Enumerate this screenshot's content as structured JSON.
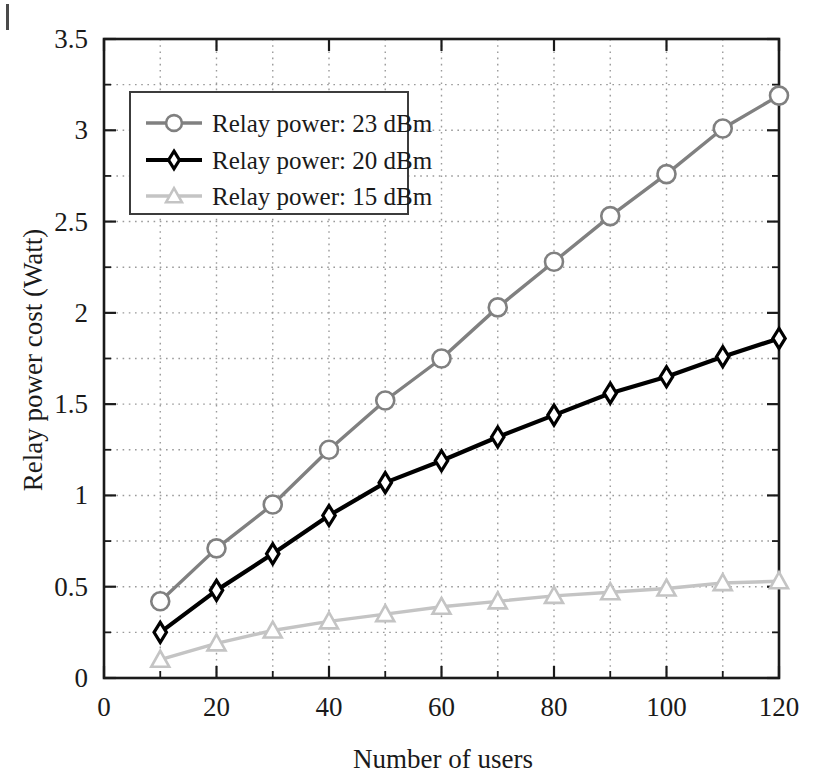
{
  "chart_data": {
    "type": "line",
    "title": "",
    "xlabel": "Number of users",
    "ylabel": "Relay power cost (Watt)",
    "xlim": [
      0,
      120
    ],
    "ylim": [
      0,
      3.5
    ],
    "xticks": [
      0,
      20,
      40,
      60,
      80,
      100,
      120
    ],
    "xticklabels": [
      "0",
      "20",
      "40",
      "60",
      "80",
      "100",
      "120"
    ],
    "yticks": [
      0,
      0.5,
      1,
      1.5,
      2,
      2.5,
      3,
      3.5
    ],
    "yticklabels": [
      "0",
      "0.5",
      "1",
      "1.5",
      "2",
      "2.5",
      "3",
      "3.5"
    ],
    "minor_tick_step_y": 0.25,
    "minor_tick_step_x": 10,
    "grid": true,
    "grid_style": "dotted",
    "legend_position": "upper left",
    "x": [
      10,
      20,
      30,
      40,
      50,
      60,
      70,
      80,
      90,
      100,
      110,
      120
    ],
    "series": [
      {
        "name": "Relay power: 23 dBm",
        "color": "#808080",
        "marker": "circle",
        "values": [
          0.42,
          0.71,
          0.95,
          1.25,
          1.52,
          1.75,
          2.03,
          2.28,
          2.53,
          2.76,
          3.01,
          3.19
        ]
      },
      {
        "name": "Relay power: 20 dBm",
        "color": "#000000",
        "marker": "diamond",
        "values": [
          0.25,
          0.48,
          0.68,
          0.89,
          1.07,
          1.19,
          1.32,
          1.44,
          1.56,
          1.65,
          1.76,
          1.86
        ]
      },
      {
        "name": "Relay power: 15 dBm",
        "color": "#c4c4c4",
        "marker": "triangle",
        "values": [
          0.1,
          0.19,
          0.26,
          0.31,
          0.35,
          0.39,
          0.42,
          0.45,
          0.47,
          0.49,
          0.52,
          0.53
        ]
      }
    ]
  },
  "legend": {
    "entries": [
      {
        "label": "Relay power: 23 dBm"
      },
      {
        "label": "Relay power: 20 dBm"
      },
      {
        "label": "Relay power: 15 dBm"
      }
    ]
  },
  "axes": {
    "x_title": "Number of users",
    "y_title": "Relay power cost (Watt)"
  }
}
